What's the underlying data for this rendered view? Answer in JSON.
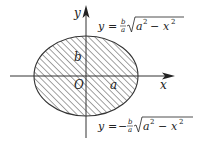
{
  "diagram": {
    "type": "ellipse-region",
    "axes": {
      "x_label": "x",
      "y_label": "y",
      "origin_label": "O"
    },
    "semi_axes": {
      "a_label": "a",
      "b_label": "b"
    },
    "region": "hatched",
    "equations": {
      "upper": {
        "lhs": "y",
        "eq": "=",
        "sign": "",
        "frac_num": "b",
        "frac_den": "a",
        "radicand_a": "a",
        "sup_a": "2",
        "minus": "−",
        "radicand_x": "x",
        "sup_x": "2"
      },
      "lower": {
        "lhs": "y",
        "eq": "=",
        "sign": "−",
        "frac_num": "b",
        "frac_den": "a",
        "radicand_a": "a",
        "sup_a": "2",
        "minus": "−",
        "radicand_x": "x",
        "sup_x": "2"
      }
    },
    "colors": {
      "stroke": "#333333",
      "hatch": "#444444",
      "background": "#ffffff"
    }
  }
}
